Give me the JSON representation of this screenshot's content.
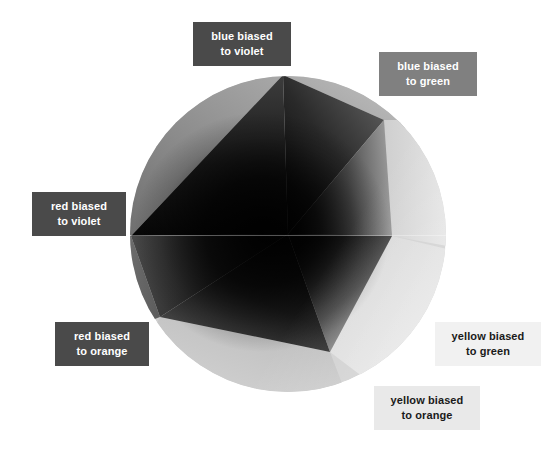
{
  "figure": {
    "background_color": "#ffffff"
  },
  "wheel": {
    "name": "color-wheel",
    "shape": "circle",
    "center_x": 288,
    "center_y": 234,
    "radius": 158,
    "rendering": "grayscale faceted gradient wheel, dark at center-left, light at right/bottom",
    "inner_polygon_vertices": [
      {
        "x": 283,
        "y": 75
      },
      {
        "x": 384,
        "y": 120
      },
      {
        "x": 392,
        "y": 236
      },
      {
        "x": 330,
        "y": 352
      },
      {
        "x": 160,
        "y": 317
      },
      {
        "x": 131,
        "y": 236
      }
    ],
    "facet_tones": [
      "#8d8d8d",
      "#9d9d9d",
      "#1e1e1e",
      "#2a2a2a",
      "#d0d0d0",
      "#e6e6e6"
    ]
  },
  "callouts": [
    {
      "id": "blue-violet",
      "line1": "blue biased",
      "line2": "to violet",
      "background": "#4a4a4a",
      "text_color": "#ffffff",
      "position": "top"
    },
    {
      "id": "blue-green",
      "line1": "blue biased",
      "line2": "to green",
      "background": "#808080",
      "text_color": "#ffffff",
      "position": "top-right"
    },
    {
      "id": "red-violet",
      "line1": "red biased",
      "line2": "to violet",
      "background": "#4a4a4a",
      "text_color": "#ffffff",
      "position": "left"
    },
    {
      "id": "red-orange",
      "line1": "red biased",
      "line2": "to orange",
      "background": "#4a4a4a",
      "text_color": "#ffffff",
      "position": "bottom-left"
    },
    {
      "id": "yellow-green",
      "line1": "yellow biased",
      "line2": "to green",
      "background": "#f1f1f1",
      "text_color": "#1a1a1a",
      "position": "right"
    },
    {
      "id": "yellow-orange",
      "line1": "yellow biased",
      "line2": "to orange",
      "background": "#e9e9e9",
      "text_color": "#1a1a1a",
      "position": "bottom-right"
    }
  ]
}
